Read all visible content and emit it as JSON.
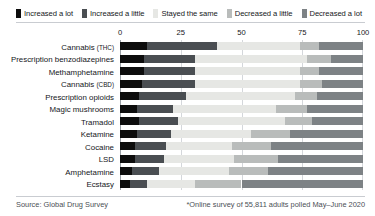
{
  "legend": {
    "items": [
      {
        "label": "Increased a lot",
        "color": "#0d0d0d"
      },
      {
        "label": "Increased a little",
        "color": "#4a4e52"
      },
      {
        "label": "Stayed the same",
        "color": "#e6e7e4"
      },
      {
        "label": "Decreased a little",
        "color": "#b9bcbb"
      },
      {
        "label": "Decreased a lot",
        "color": "#7d8285"
      }
    ]
  },
  "footer": {
    "source": "Source: Global Drug Survey",
    "note": "*Online survey of 55,811 adults polled May–June 2020"
  },
  "chart_data": {
    "type": "bar",
    "orientation": "horizontal",
    "stacked": true,
    "title": "",
    "xlabel": "",
    "ylabel": "",
    "xlim": [
      0,
      100
    ],
    "xticks": [
      0,
      25,
      50,
      75,
      100
    ],
    "xtick_labels": [
      "0",
      "25",
      "50",
      "75",
      "100"
    ],
    "grid": true,
    "legend_position": "top",
    "categories": [
      "Cannabis (THC)",
      "Prescription benzodiazepines",
      "Methamphetamine",
      "Cannabis (CBD)",
      "Prescription opioids",
      "Magic mushrooms",
      "Tramadol",
      "Ketamine",
      "Cocaine",
      "LSD",
      "Amphetamine",
      "Ecstasy"
    ],
    "category_parts": [
      {
        "main": "Cannabis ",
        "sub": "(THC)"
      },
      {
        "main": "Prescription benzodiazepines",
        "sub": ""
      },
      {
        "main": "Methamphetamine",
        "sub": ""
      },
      {
        "main": "Cannabis ",
        "sub": "(CBD)"
      },
      {
        "main": "Prescription opioids",
        "sub": ""
      },
      {
        "main": "Magic mushrooms",
        "sub": ""
      },
      {
        "main": "Tramadol",
        "sub": ""
      },
      {
        "main": "Ketamine",
        "sub": ""
      },
      {
        "main": "Cocaine",
        "sub": ""
      },
      {
        "main": "LSD",
        "sub": ""
      },
      {
        "main": "Amphetamine",
        "sub": ""
      },
      {
        "main": "Ecstasy",
        "sub": ""
      }
    ],
    "series": [
      {
        "name": "Increased a lot",
        "color": "#0d0d0d",
        "values": [
          11,
          10,
          10,
          9,
          8,
          7,
          8,
          7,
          6,
          6,
          5,
          4
        ]
      },
      {
        "name": "Increased a little",
        "color": "#4a4e52",
        "values": [
          29,
          21,
          21,
          22,
          19,
          15,
          16,
          14,
          13,
          12,
          11,
          7
        ]
      },
      {
        "name": "Stayed the same",
        "color": "#e6e7e4",
        "values": [
          34,
          46,
          43,
          43,
          45,
          42,
          44,
          33,
          27,
          29,
          29,
          20
        ]
      },
      {
        "name": "Decreased a little",
        "color": "#b9bcbb",
        "values": [
          8,
          10,
          8,
          9,
          9,
          13,
          11,
          16,
          16,
          18,
          16,
          19
        ]
      },
      {
        "name": "Decreased a lot",
        "color": "#7d8285",
        "values": [
          18,
          13,
          18,
          17,
          19,
          23,
          21,
          30,
          38,
          35,
          39,
          50
        ]
      }
    ]
  }
}
